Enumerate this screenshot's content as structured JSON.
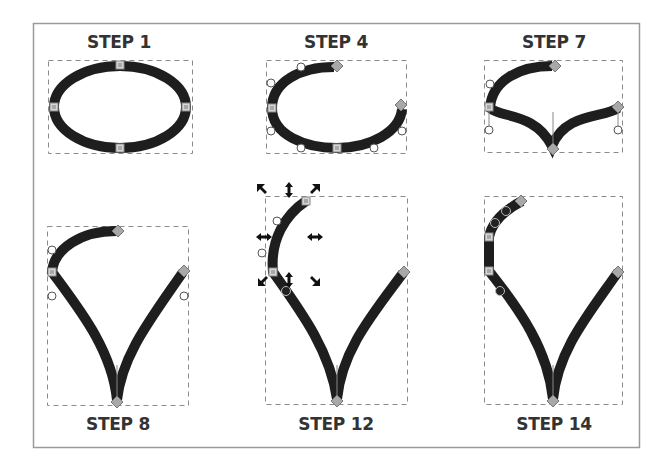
{
  "figure": {
    "steps": [
      {
        "id": "step-1",
        "label": "STEP 1",
        "shape": "closed ellipse with 4 square nodes"
      },
      {
        "id": "step-4",
        "label": "STEP 4",
        "shape": "open ellipse, break at top-right, arrow end markers"
      },
      {
        "id": "step-7",
        "label": "STEP 7",
        "shape": "open curve with bottom cusp node"
      },
      {
        "id": "step-8",
        "label": "STEP 8",
        "shape": "teardrop outline, V bottom"
      },
      {
        "id": "step-12",
        "label": "STEP 12",
        "shape": "teardrop with selected upper-left segment and transform arrows"
      },
      {
        "id": "step-14",
        "label": "STEP 14",
        "shape": "teardrop with extra nodes on upper-left"
      }
    ]
  },
  "colors": {
    "stroke": "#1e1e1e",
    "bbox_dash": "#8a8a8a",
    "frame": "#9a9a9a",
    "node_fill": "#bdbdbd",
    "handle_stroke": "#555555",
    "label": "#333333"
  }
}
